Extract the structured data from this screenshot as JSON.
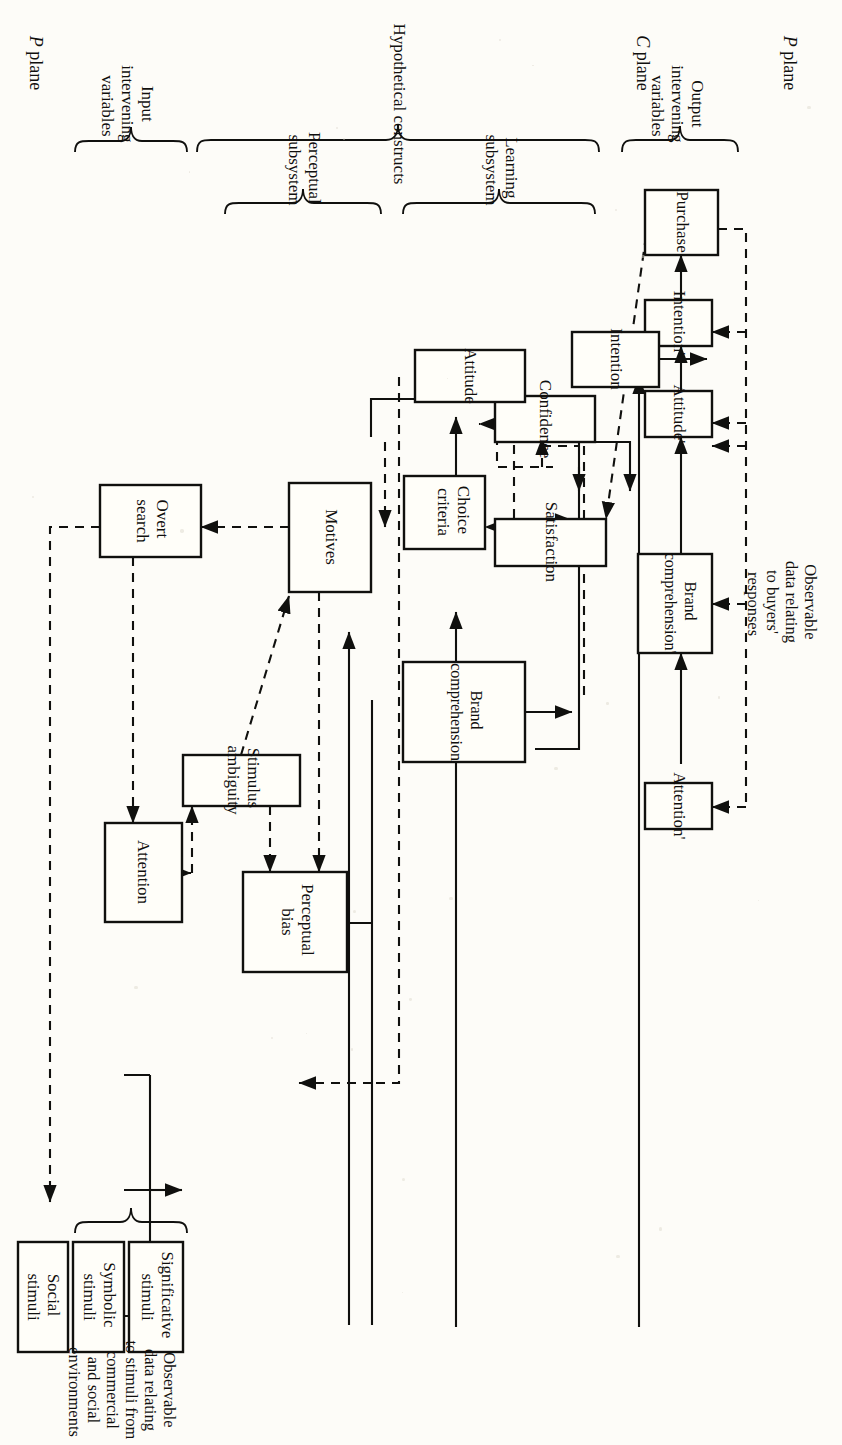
{
  "figure": {
    "planes": {
      "p_plane_top": "P plane",
      "p_plane_bottom": "P plane",
      "c_plane": "C plane"
    },
    "group_labels": {
      "output_intervening_variables": "Output\nintervening\nvariables",
      "hypothetical_constructs": "Hypothetical constructs",
      "learning_subsystem": "Learning\nsubsystem",
      "perceptual_subsystem": "Perceptual\nsubsystem",
      "input_intervening_variables": "Input\nintervening\nvariables"
    },
    "annotations": {
      "buyer_responses": "Observable\ndata relating\nto buyers'\nresponses",
      "stimuli_sources": "Observable\ndata relating\nto stimuli from\ncommercial\nand social\nenvironments"
    },
    "nodes": {
      "purchase": "Purchase",
      "intention_prime": "Intention'",
      "attitude_prime": "Attitude'",
      "brand_comprehension_prime": "Brand\ncomprehension'",
      "attention_prime": "Attention'",
      "intention": "Intention",
      "attitude": "Attitude",
      "confidence": "Confidence",
      "satisfaction": "Satisfaction",
      "choice_criteria": "Choice\ncriteria",
      "brand_comprehension": "Brand\ncomprehension",
      "motives": "Motives",
      "stimulus_ambiguity": "Stimulus\nambiguity",
      "perceptual_bias": "Perceptual\nbias",
      "overt_search": "Overt\nsearch",
      "attention": "Attention",
      "significative_stimuli": "Significative\nstimuli",
      "symbolic_stimuli": "Symbolic\nstimuli",
      "social_stimuli": "Social\nstimuli"
    },
    "colors": {
      "ink": "#10100e",
      "paper": "#fdfcf8",
      "box_fill": "#fffef9"
    },
    "legend": {
      "solid": "solid line = flow of influence",
      "dashed": "dashed line = feedback effect"
    }
  }
}
